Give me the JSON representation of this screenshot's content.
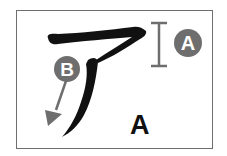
{
  "diagram": {
    "glyph": "katakana-a",
    "labels": {
      "marker_a": "A",
      "marker_b": "B",
      "caption": "A"
    },
    "colors": {
      "stroke": "#111111",
      "marker": "#6e6e6e",
      "frame": "#6e6e6e",
      "marker_text": "#ffffff"
    }
  }
}
